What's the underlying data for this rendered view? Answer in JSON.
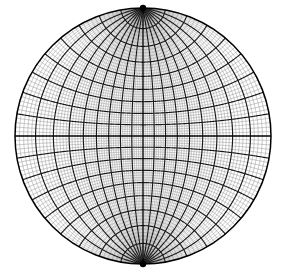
{
  "figure": {
    "name": "wulff-net",
    "projection": "stereographic",
    "orientation": "meridional",
    "background_color": "#ffffff",
    "line_color": "#1a1a1a",
    "minor_line_color": "#8a8a8a",
    "axis_line_color": "#000000"
  },
  "chart_data": {
    "type": "line",
    "xlabel": "",
    "ylabel": "",
    "grid": true,
    "legend": false,
    "projection": "stereographic-equal-angle",
    "primitive_circle": {
      "center_x": 143,
      "center_y": 136,
      "radius": 128
    },
    "poles": [
      {
        "label": "north-pole",
        "x": 143,
        "y": 8
      },
      {
        "label": "south-pole",
        "x": 143,
        "y": 264
      }
    ],
    "minor_interval_degrees": 2,
    "major_interval_degrees": 10,
    "longitude_range_degrees": [
      -90,
      90
    ],
    "latitude_range_degrees": [
      -90,
      90
    ],
    "meridian_longitudes_major": [
      -90,
      -80,
      -70,
      -60,
      -50,
      -40,
      -30,
      -20,
      -10,
      0,
      10,
      20,
      30,
      40,
      50,
      60,
      70,
      80,
      90
    ],
    "parallel_latitudes_major": [
      -80,
      -70,
      -60,
      -50,
      -40,
      -30,
      -20,
      -10,
      0,
      10,
      20,
      30,
      40,
      50,
      60,
      70,
      80
    ],
    "axis_lines": [
      "equator",
      "central-meridian"
    ],
    "pole_dot_radius": 3.2
  }
}
